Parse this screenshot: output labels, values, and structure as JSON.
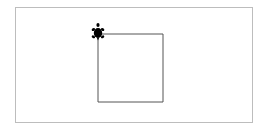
{
  "canvas": {
    "background": "#ffffff",
    "border_color": "#bdbdbd"
  },
  "drawing": {
    "shape": "square",
    "stroke_color": "#555555",
    "points": [
      [
        98,
        34
      ],
      [
        163,
        34
      ],
      [
        163,
        102
      ],
      [
        98,
        102
      ]
    ]
  },
  "turtle": {
    "icon": "turtle-icon",
    "color": "#000000",
    "x": 98,
    "y": 33,
    "heading": "north"
  }
}
